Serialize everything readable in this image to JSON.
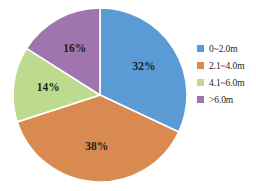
{
  "chart_data": {
    "type": "pie",
    "title": "",
    "xlabel": "",
    "ylabel": "",
    "legend_position": "right",
    "grid": false,
    "start_angle_deg": 0,
    "direction": "clockwise",
    "categories": [
      "0~2.0m",
      "2.1~4.0m",
      "4.1~6.0m",
      ">6.0m"
    ],
    "values": [
      32,
      38,
      14,
      16
    ],
    "value_unit": "%",
    "data_labels": [
      "32%",
      "38%",
      "14%",
      "16%"
    ],
    "colors": [
      "#5B9BD5",
      "#D98A50",
      "#BCDB8F",
      "#A074AC"
    ],
    "slices": [
      {
        "label": "0~2.0m",
        "value": 32,
        "data_label": "32%",
        "color": "#5B9BD5"
      },
      {
        "label": "2.1~4.0m",
        "value": 38,
        "data_label": "38%",
        "color": "#D98A50"
      },
      {
        "label": "4.1~6.0m",
        "value": 14,
        "data_label": "14%",
        "color": "#BCDB8F"
      },
      {
        "label": ">6.0m",
        "value": 16,
        "data_label": "16%",
        "color": "#A074AC"
      }
    ]
  },
  "legend": {
    "items": [
      {
        "label": "0~2.0m",
        "color": "#5B9BD5"
      },
      {
        "label": "2.1~4.0m",
        "color": "#D98A50"
      },
      {
        "label": "4.1~6.0m",
        "color": "#BCDB8F"
      },
      {
        "label": ">6.0m",
        "color": "#A074AC"
      }
    ]
  },
  "style": {
    "background": "#ffffff",
    "slice_border": "#ffffff",
    "label_color": "#231f20"
  }
}
